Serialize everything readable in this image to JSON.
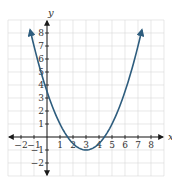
{
  "chart_data": {
    "type": "line",
    "title": "",
    "xlabel": "x",
    "ylabel": "y",
    "xlim": [
      -3,
      9
    ],
    "ylim": [
      -3,
      9
    ],
    "grid": true,
    "x_ticks": [
      -2,
      -1,
      1,
      2,
      3,
      4,
      5,
      6,
      7,
      8
    ],
    "y_ticks": [
      -2,
      -1,
      1,
      2,
      3,
      4,
      5,
      6,
      7,
      8
    ],
    "series": [
      {
        "name": "parabola",
        "equation": "y = 0.5(x - 3)^2 - 1",
        "vertex": [
          3,
          -1
        ],
        "y_intercept": 3.5,
        "x_intercepts": [
          1.59,
          4.41
        ],
        "x_range": [
          -1.3,
          7.3
        ],
        "color": "#2e5d7e",
        "arrows_at_ends": true
      }
    ]
  },
  "colors": {
    "grid": "#d9d9d9",
    "axis": "#1a1a1a",
    "curve": "#2e5d7e",
    "text": "#333333"
  }
}
